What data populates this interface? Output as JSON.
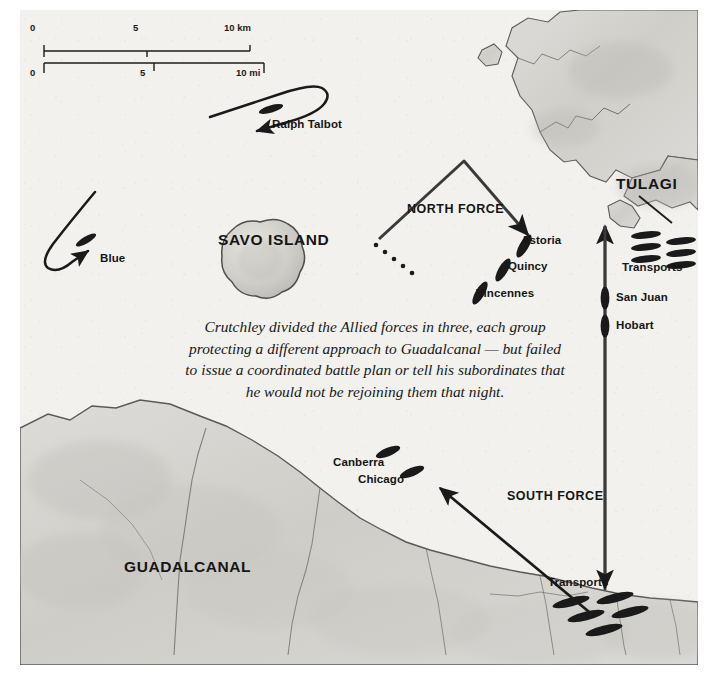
{
  "map": {
    "title_region": "Battle of Savo Island — Allied dispositions",
    "background_color": "#f2f1ee",
    "land_color": "#d7d6d2",
    "ink_color": "#1a1a1a"
  },
  "scale": {
    "km_ticks": [
      "0",
      "5",
      "10 km"
    ],
    "mi_ticks": [
      "0",
      "5",
      "10 mi"
    ]
  },
  "places": [
    {
      "name": "SAVO ISLAND",
      "x": 218,
      "y": 230
    },
    {
      "name": "TULAGI",
      "x": 616,
      "y": 175
    },
    {
      "name": "GUADALCANAL",
      "x": 124,
      "y": 558
    }
  ],
  "forces": [
    {
      "label": "NORTH FORCE",
      "x": 411,
      "y": 200
    },
    {
      "label": "SOUTH FORCE",
      "x": 508,
      "y": 487
    }
  ],
  "ships": [
    {
      "name": "Ralph Talbot",
      "label_x": 272,
      "label_y": 115,
      "type": "destroyer"
    },
    {
      "name": "Blue",
      "label_x": 98,
      "label_y": 248,
      "type": "destroyer"
    },
    {
      "name": "Astoria",
      "label_x": 521,
      "label_y": 231,
      "type": "cruiser"
    },
    {
      "name": "Quincy",
      "label_x": 508,
      "label_y": 257,
      "type": "cruiser"
    },
    {
      "name": "Vincennes",
      "label_x": 477,
      "label_y": 284,
      "type": "cruiser"
    },
    {
      "name": "San Juan",
      "label_x": 608,
      "label_y": 286,
      "type": "cruiser"
    },
    {
      "name": "Hobart",
      "label_x": 608,
      "label_y": 313,
      "type": "cruiser"
    },
    {
      "name": "Canberra",
      "label_x": 333,
      "label_y": 453,
      "type": "cruiser"
    },
    {
      "name": "Chicago",
      "label_x": 358,
      "label_y": 470,
      "type": "cruiser"
    }
  ],
  "transport_groups": [
    {
      "label": "Transports",
      "label_x": 621,
      "label_y": 258,
      "count": 6,
      "location": "Tulagi"
    },
    {
      "label": "Transports",
      "label_x": 547,
      "label_y": 574,
      "count": 5,
      "location": "Guadalcanal (Lunga)"
    }
  ],
  "caption": {
    "lines": [
      "Crutchley divided the Allied forces in three, each group",
      "protecting a different approach to Guadalcanal — but failed",
      "to issue a coordinated battle plan or tell his subordinates that",
      "he would not be rejoining them that night."
    ]
  }
}
